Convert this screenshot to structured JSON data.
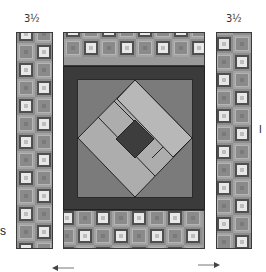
{
  "labels": {
    "left_strip_width": "3½",
    "right_strip_width": "3½",
    "left_edge_fragment": "s",
    "right_edge_fragment": "I"
  },
  "diagram": {
    "type": "quilt assembly diagram",
    "parts": [
      {
        "name": "left border strip",
        "width_label": "3½",
        "pattern": "concentric squares"
      },
      {
        "name": "center block top tile border",
        "pattern": "concentric squares"
      },
      {
        "name": "center framed on-point block",
        "components": [
          "dark outer frame",
          "medium gray background",
          "light diamond with strips",
          "dark center square"
        ]
      },
      {
        "name": "center block bottom tile border",
        "pattern": "concentric squares"
      },
      {
        "name": "right border strip",
        "width_label": "3½",
        "pattern": "concentric squares"
      }
    ],
    "arrows": [
      {
        "direction": "left",
        "position": "below left strip"
      },
      {
        "direction": "right",
        "position": "below right strip"
      }
    ]
  },
  "colors": {
    "frame_dark": "#3b3b3b",
    "background_mid": "#7b7b7b",
    "diamond_light": "#b0b0b0",
    "center_square": "#3d3d3d",
    "tile_light": "#e8e8e8",
    "tile_mid": "#9a9a9a"
  }
}
